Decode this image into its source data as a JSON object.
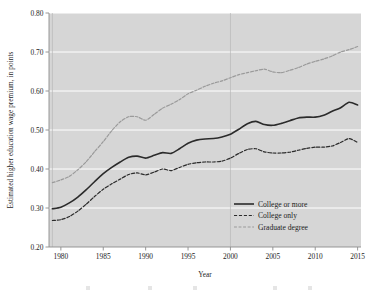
{
  "chart_data": {
    "type": "line",
    "title": "",
    "xlabel": "Year",
    "ylabel": "Estimated higher education wage premium, in points",
    "xlim": [
      1978.6,
      2015.4
    ],
    "ylim": [
      0.2,
      0.8
    ],
    "grid": "horizontal-white-gridlines-plus-vertical-at-1979-and-2000",
    "legend_position": "lower-right-inside-plot",
    "xticks": [
      1980,
      1985,
      1990,
      1995,
      2000,
      2005,
      2010,
      2015
    ],
    "xtick_labels": [
      "1980",
      "1985",
      "1990",
      "1995",
      "2000",
      "2005",
      "2010",
      "2015"
    ],
    "yticks": [
      0.2,
      0.3,
      0.4,
      0.5,
      0.6,
      0.7,
      0.8
    ],
    "ytick_labels": [
      "0.20",
      "0.30",
      "0.40",
      "0.50",
      "0.60",
      "0.70",
      "0.80"
    ],
    "x": [
      1979,
      1980,
      1981,
      1982,
      1983,
      1984,
      1985,
      1986,
      1987,
      1988,
      1989,
      1990,
      1991,
      1992,
      1993,
      1994,
      1995,
      1996,
      1997,
      1998,
      1999,
      2000,
      2001,
      2002,
      2003,
      2004,
      2005,
      2006,
      2007,
      2008,
      2009,
      2010,
      2011,
      2012,
      2013,
      2014,
      2015
    ],
    "series": [
      {
        "name": "College or more",
        "style": "solid",
        "color": "#2b2b2b",
        "width": 1.6,
        "values": [
          0.298,
          0.302,
          0.313,
          0.328,
          0.347,
          0.368,
          0.388,
          0.404,
          0.418,
          0.43,
          0.433,
          0.428,
          0.435,
          0.442,
          0.44,
          0.452,
          0.466,
          0.474,
          0.477,
          0.478,
          0.482,
          0.489,
          0.502,
          0.516,
          0.522,
          0.514,
          0.512,
          0.517,
          0.524,
          0.531,
          0.533,
          0.533,
          0.538,
          0.548,
          0.557,
          0.571,
          0.564
        ]
      },
      {
        "name": "College only",
        "style": "dashed",
        "color": "#2b2b2b",
        "width": 1.2,
        "values": [
          0.268,
          0.27,
          0.278,
          0.292,
          0.31,
          0.33,
          0.348,
          0.362,
          0.374,
          0.386,
          0.39,
          0.385,
          0.392,
          0.4,
          0.396,
          0.404,
          0.412,
          0.416,
          0.418,
          0.418,
          0.42,
          0.428,
          0.44,
          0.45,
          0.452,
          0.444,
          0.441,
          0.441,
          0.443,
          0.448,
          0.453,
          0.456,
          0.456,
          0.459,
          0.468,
          0.478,
          0.468
        ]
      },
      {
        "name": "Graduate degree",
        "style": "dashdot",
        "color": "#9a9a9a",
        "width": 1.2,
        "values": [
          0.365,
          0.372,
          0.381,
          0.398,
          0.419,
          0.445,
          0.47,
          0.498,
          0.521,
          0.534,
          0.534,
          0.525,
          0.54,
          0.556,
          0.566,
          0.578,
          0.593,
          0.602,
          0.612,
          0.62,
          0.626,
          0.634,
          0.642,
          0.647,
          0.652,
          0.656,
          0.649,
          0.647,
          0.653,
          0.66,
          0.669,
          0.676,
          0.682,
          0.69,
          0.7,
          0.706,
          0.714
        ]
      }
    ],
    "annotations": []
  },
  "legend": {
    "entries": [
      {
        "label": "College or more"
      },
      {
        "label": "College only"
      },
      {
        "label": "Graduate degree"
      }
    ]
  },
  "axes": {
    "x_title": "Year",
    "y_title": "Estimated higher education wage premium, in points"
  },
  "colors": {
    "plot_background": "#d6d6d6",
    "page_background": "#ffffff",
    "gridline": "#ffffff",
    "vertical_gridline": "#b8b8b8",
    "axis_line": "#8c8c8c",
    "primary_line": "#2b2b2b",
    "secondary_line": "#9a9a9a",
    "text": "#1d1d1d"
  },
  "footer_artifacts": {
    "items": [
      "",
      "",
      "",
      "",
      ""
    ]
  }
}
